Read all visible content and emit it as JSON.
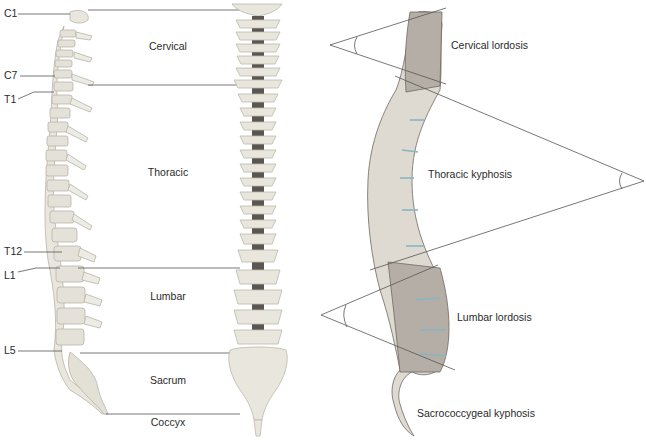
{
  "vertebra_labels": [
    {
      "label": "C1",
      "y": 14
    },
    {
      "label": "C7",
      "y": 76
    },
    {
      "label": "T1",
      "y": 99
    },
    {
      "label": "T12",
      "y": 252
    },
    {
      "label": "L1",
      "y": 276
    },
    {
      "label": "L5",
      "y": 351
    }
  ],
  "region_labels": [
    {
      "label": "Cervical",
      "y": 47
    },
    {
      "label": "Thoracic",
      "y": 173
    },
    {
      "label": "Lumbar",
      "y": 297
    },
    {
      "label": "Sacrum",
      "y": 381
    },
    {
      "label": "Coccyx",
      "y": 420
    }
  ],
  "curvature_labels": [
    {
      "label": "Cervical lordosis",
      "x": 451,
      "y": 46
    },
    {
      "label": "Thoracic kyphosis",
      "x": 428,
      "y": 175
    },
    {
      "label": "Lumbar lordosis",
      "x": 457,
      "y": 318
    },
    {
      "label": "Sacrococcygeal kyphosis",
      "x": 417,
      "y": 414
    }
  ],
  "colors": {
    "bone_light": "#e8e5dc",
    "bone_grey": "#b8b0a8",
    "line": "#555555",
    "disc": "#c8dde4"
  }
}
